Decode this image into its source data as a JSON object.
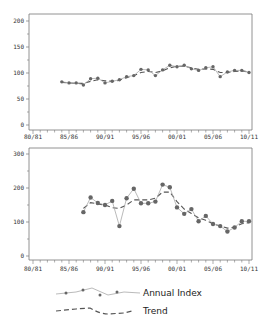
{
  "chart_data": [
    {
      "type": "line",
      "panel": "top",
      "title": "",
      "xlabel": "",
      "ylabel": "",
      "ylim": [
        0,
        200
      ],
      "yticks": [
        0,
        50,
        100,
        150,
        200
      ],
      "ytick_labels": [
        "0",
        "50",
        "100",
        "150",
        "200"
      ],
      "xlim": [
        1980.5,
        2010.5
      ],
      "xticks": [
        1980.5,
        1985.5,
        1990.5,
        1995.5,
        2000.5,
        2005.5,
        2010.5
      ],
      "xtick_labels": [
        "80/81",
        "85/86",
        "90/91",
        "95/96",
        "00/01",
        "05/06",
        "10/11"
      ],
      "grid": false,
      "x": [
        1984.5,
        1985.5,
        1986.5,
        1987.5,
        1988.5,
        1989.5,
        1990.5,
        1991.5,
        1992.5,
        1993.5,
        1994.5,
        1995.5,
        1996.5,
        1997.5,
        1998.5,
        1999.5,
        2000.5,
        2001.5,
        2002.5,
        2003.5,
        2004.5,
        2005.5,
        2006.5,
        2007.5,
        2008.5,
        2009.5,
        2010.5
      ],
      "series": [
        {
          "name": "Annual Index",
          "style": "solid-markers",
          "values": [
            83,
            81,
            81,
            77,
            89,
            90,
            81,
            84,
            87,
            93,
            95,
            107,
            106,
            95,
            106,
            115,
            112,
            115,
            108,
            105,
            110,
            112,
            93,
            102,
            105,
            105,
            101
          ]
        },
        {
          "name": "Trend",
          "style": "dashed",
          "values": [
            82,
            81,
            80,
            80,
            84,
            87,
            85,
            84,
            86,
            91,
            95,
            101,
            103,
            101,
            104,
            110,
            113,
            113,
            110,
            107,
            108,
            107,
            101,
            101,
            103,
            104,
            102
          ]
        }
      ]
    },
    {
      "type": "line",
      "panel": "bottom",
      "title": "",
      "xlabel": "",
      "ylabel": "",
      "ylim": [
        0,
        300
      ],
      "yticks": [
        0,
        100,
        200,
        300
      ],
      "ytick_labels": [
        "0",
        "100",
        "200",
        "300"
      ],
      "xlim": [
        1980.5,
        2010.5
      ],
      "xticks": [
        1980.5,
        1985.5,
        1990.5,
        1995.5,
        2000.5,
        2005.5,
        2010.5
      ],
      "xtick_labels": [
        "80/81",
        "85/86",
        "90/91",
        "95/96",
        "00/01",
        "05/06",
        "10/11"
      ],
      "grid": false,
      "x": [
        1987.5,
        1988.5,
        1989.5,
        1990.5,
        1991.5,
        1992.5,
        1993.5,
        1994.5,
        1995.5,
        1996.5,
        1997.5,
        1998.5,
        1999.5,
        2000.5,
        2001.5,
        2002.5,
        2003.5,
        2004.5,
        2005.5,
        2006.5,
        2007.5,
        2008.5,
        2009.5,
        2010.5
      ],
      "series": [
        {
          "name": "Annual Index",
          "style": "solid-markers",
          "values": [
            129,
            172,
            156,
            150,
            162,
            88,
            170,
            198,
            155,
            155,
            160,
            210,
            202,
            143,
            124,
            138,
            102,
            118,
            94,
            88,
            72,
            84,
            102,
            102
          ]
        },
        {
          "name": "Trend",
          "style": "dashed",
          "values": [
            140,
            157,
            153,
            150,
            142,
            140,
            150,
            165,
            165,
            165,
            170,
            188,
            188,
            160,
            138,
            125,
            112,
            105,
            95,
            88,
            82,
            85,
            95,
            98
          ]
        }
      ]
    }
  ],
  "legend": {
    "items": [
      {
        "label": "Annual Index",
        "style": "solid-markers"
      },
      {
        "label": "Trend",
        "style": "dashed"
      }
    ],
    "position": "bottom-center"
  },
  "colors": {
    "index_line": "#a8a8a8",
    "index_marker": "#666666",
    "trend_line": "#555555",
    "axis": "#777777",
    "text": "#333333"
  }
}
